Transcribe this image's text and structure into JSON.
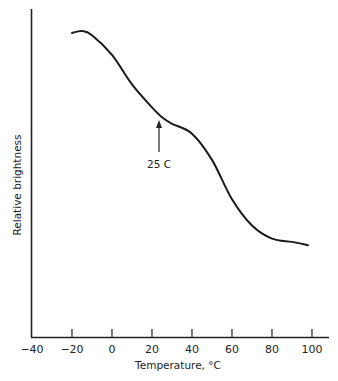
{
  "chart_data": {
    "type": "line",
    "title": "",
    "xlabel": "Temperature, °C",
    "ylabel": "Relative brightness",
    "xlim": [
      -40,
      105
    ],
    "ylim": [
      0,
      100
    ],
    "x_ticks": [
      -40,
      -20,
      0,
      20,
      40,
      60,
      80,
      100
    ],
    "x_tick_labels": [
      "−40",
      "−20",
      "0",
      "20",
      "40",
      "60",
      "80",
      "100"
    ],
    "y_ticks": [],
    "grid": false,
    "legend": null,
    "series": [
      {
        "name": "Relative brightness",
        "x": [
          -20,
          -15,
          -10,
          0,
          10,
          20,
          25,
          30,
          40,
          50,
          60,
          70,
          80,
          90,
          98
        ],
        "y": [
          92.7,
          93.3,
          92,
          86,
          77,
          70,
          67,
          65,
          62,
          54,
          42,
          34,
          30,
          29,
          28
        ]
      }
    ],
    "annotations": [
      {
        "text": "25 C",
        "x": 25,
        "arrow": "up",
        "points_to_y": 67
      }
    ]
  }
}
